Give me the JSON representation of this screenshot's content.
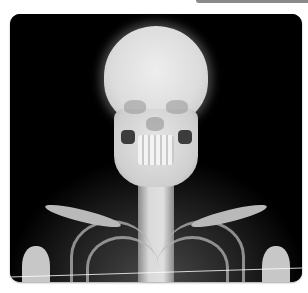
{
  "image": {
    "subject": "frontal X-ray radiograph of skull, cervical spine, clavicles and upper ribcage",
    "frame": {
      "background": "#000000",
      "border_radius_px": 10
    },
    "colors": {
      "bone": "#e0e0e0",
      "background": "#000000",
      "page": "#ffffff",
      "top_bar": "#8a8a8a"
    }
  }
}
